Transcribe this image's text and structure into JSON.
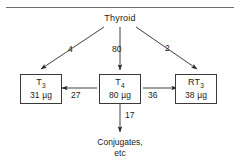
{
  "figure": {
    "top_rule": true,
    "source": {
      "label": "Thyroid"
    },
    "nodes": [
      {
        "id": "t3",
        "label": "T",
        "subscript": "3",
        "value": "31 µg"
      },
      {
        "id": "t4",
        "label": "T",
        "subscript": "4",
        "value": "80 µg"
      },
      {
        "id": "rt3",
        "label": "RT",
        "subscript": "3",
        "value": "38 µg"
      }
    ],
    "sink": {
      "line1": "Conjugates,",
      "line2": "etc"
    },
    "flows": [
      {
        "id": "thyroid-to-t3",
        "from": "Thyroid",
        "to": "T3",
        "value": "4"
      },
      {
        "id": "thyroid-to-t4",
        "from": "Thyroid",
        "to": "T4",
        "value": "80"
      },
      {
        "id": "thyroid-to-rt3",
        "from": "Thyroid",
        "to": "RT3",
        "value": "2"
      },
      {
        "id": "t4-to-t3",
        "from": "T4",
        "to": "T3",
        "value": "27"
      },
      {
        "id": "t4-to-rt3",
        "from": "T4",
        "to": "RT3",
        "value": "36"
      },
      {
        "id": "t4-to-conj",
        "from": "T4",
        "to": "Conjugates",
        "value": "17"
      }
    ],
    "colors": {
      "stroke": "#2a2a2a",
      "rule": "#6e6e6e",
      "text": "#1c1c1c",
      "background": "#ffffff"
    }
  }
}
